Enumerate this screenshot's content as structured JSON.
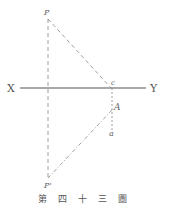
{
  "figure": {
    "caption": "第 四 十 三 圖",
    "ground_line": {
      "left_label": "X",
      "right_label": "Y"
    },
    "points": {
      "P": {
        "label": "P"
      },
      "P_prime": {
        "label": "P'"
      },
      "c": {
        "label": "c"
      },
      "A": {
        "label": "A"
      },
      "a": {
        "label": "a"
      }
    },
    "colors": {
      "line": "#555555",
      "dashed": "#888888",
      "text": "#555555"
    }
  }
}
